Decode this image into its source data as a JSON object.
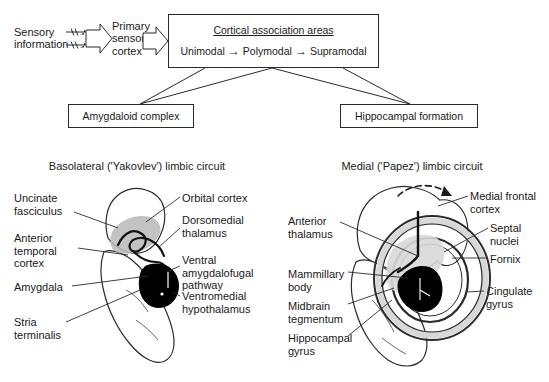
{
  "flowchart": {
    "source_label": "Sensory\ninformation",
    "primary_label": "Primary\nsensory\ncortex",
    "cortical_box": {
      "title": "Cortical association areas",
      "stages": [
        "Unimodal",
        "Polymodal",
        "Supramodal"
      ],
      "arrow_glyph": "→"
    },
    "amygdaloid_box": "Amygdaloid complex",
    "hippocampal_box": "Hippocampal formation"
  },
  "panels": {
    "left": {
      "title": "Basolateral ('Yakovlev') limbic circuit",
      "labels_left": [
        "Uncinate\nfasciculus",
        "Anterior\ntemporal\ncortex",
        "Amygdala",
        "Stria\nterminalis"
      ],
      "labels_right": [
        "Orbital cortex",
        "Dorsomedial\nthalamus",
        "Ventral\namygdalofugal\npathway",
        "Ventromedial\nhypothalamus"
      ]
    },
    "right": {
      "title": "Medial ('Papez') limbic circuit",
      "labels_left": [
        "Anterior\nthalamus",
        "Mammillary\nbody",
        "Midbrain\ntegmentum",
        "Hippocampal\ngyrus"
      ],
      "labels_right": [
        "Medial frontal\ncortex",
        "Septal\nnuclei",
        "Fornix",
        "Cingulate\ngyrus"
      ]
    }
  },
  "colors": {
    "ink": "#1a1a1a",
    "outline": "#2b2b2b",
    "shade_gray": "#b9b9b9",
    "shade_light": "#d8d8d8",
    "solid_black": "#000000",
    "page": "#ffffff"
  }
}
